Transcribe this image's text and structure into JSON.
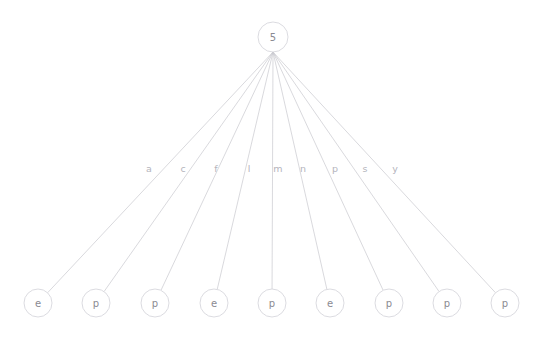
{
  "diagram": {
    "type": "tree",
    "background_color": "#ffffff",
    "edge_color": "#c9c9cf",
    "node_stroke_color": "#d2d2d8",
    "node_fill_color": "#ffffff",
    "node_text_color": "#8a8a92",
    "edge_label_color": "#b4b4bc",
    "root": {
      "id": "root",
      "label": "5",
      "cx": 273,
      "cy": 37,
      "r": 15
    },
    "edge_label_row_y": 168,
    "edges": [
      {
        "label": "a",
        "label_x": 149,
        "target": "leaf-1"
      },
      {
        "label": "c",
        "label_x": 183,
        "target": "leaf-2"
      },
      {
        "label": "f",
        "label_x": 216,
        "target": "leaf-3"
      },
      {
        "label": "l",
        "label_x": 249,
        "target": "leaf-4"
      },
      {
        "label": "m",
        "label_x": 278,
        "target": "leaf-5"
      },
      {
        "label": "n",
        "label_x": 303,
        "target": "leaf-6"
      },
      {
        "label": "p",
        "label_x": 335,
        "target": "leaf-7"
      },
      {
        "label": "s",
        "label_x": 365,
        "target": "leaf-8"
      },
      {
        "label": "y",
        "label_x": 395,
        "target": "leaf-9"
      }
    ],
    "leaves": [
      {
        "id": "leaf-1",
        "label": "e",
        "cx": 38,
        "cy": 303,
        "r": 14
      },
      {
        "id": "leaf-2",
        "label": "p",
        "cx": 96,
        "cy": 303,
        "r": 14
      },
      {
        "id": "leaf-3",
        "label": "p",
        "cx": 155,
        "cy": 303,
        "r": 14
      },
      {
        "id": "leaf-4",
        "label": "e",
        "cx": 214,
        "cy": 303,
        "r": 14
      },
      {
        "id": "leaf-5",
        "label": "p",
        "cx": 272,
        "cy": 303,
        "r": 14
      },
      {
        "id": "leaf-6",
        "label": "e",
        "cx": 330,
        "cy": 303,
        "r": 14
      },
      {
        "id": "leaf-7",
        "label": "p",
        "cx": 389,
        "cy": 303,
        "r": 14
      },
      {
        "id": "leaf-8",
        "label": "p",
        "cx": 447,
        "cy": 303,
        "r": 14
      },
      {
        "id": "leaf-9",
        "label": "p",
        "cx": 505,
        "cy": 303,
        "r": 14
      }
    ]
  }
}
